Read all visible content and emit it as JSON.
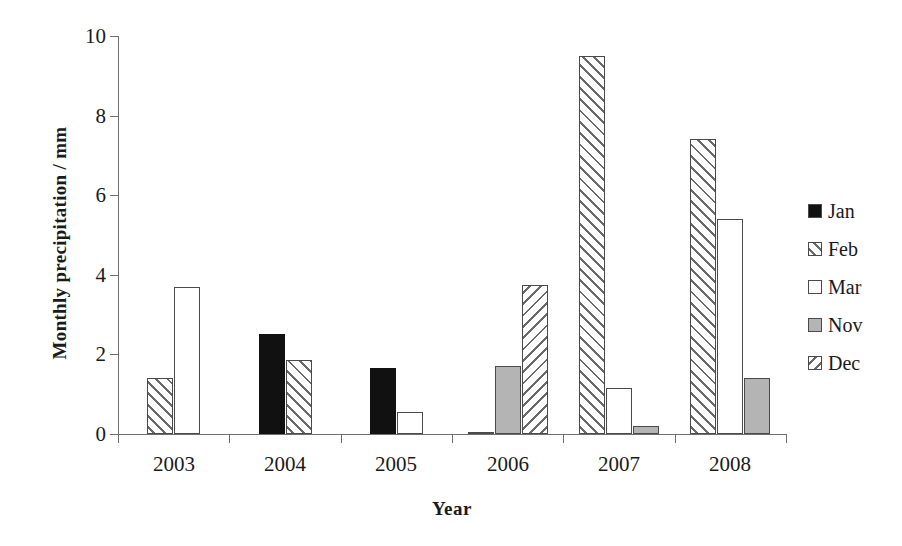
{
  "chart_data": {
    "type": "bar",
    "title": "",
    "xlabel": "Year",
    "ylabel": "Monthly precipitation / mm",
    "categories": [
      "2003",
      "2004",
      "2005",
      "2006",
      "2007",
      "2008"
    ],
    "ylim": [
      0,
      10
    ],
    "yticks": [
      0,
      2,
      4,
      6,
      8,
      10
    ],
    "ytick_labels": [
      "0",
      "2",
      "4",
      "6",
      "8",
      "10"
    ],
    "grid": false,
    "legend_position": "right",
    "series": [
      {
        "name": "Jan",
        "fill": "solid-black",
        "color": "#111111",
        "values": [
          null,
          2.5,
          1.65,
          null,
          null,
          null
        ]
      },
      {
        "name": "Feb",
        "fill": "hatch-forward",
        "color": "#6a6a6a",
        "values": [
          1.4,
          1.85,
          null,
          null,
          9.5,
          7.4
        ]
      },
      {
        "name": "Mar",
        "fill": "white",
        "color": "#ffffff",
        "values": [
          3.7,
          null,
          0.55,
          0.05,
          1.15,
          5.4
        ]
      },
      {
        "name": "Nov",
        "fill": "gray",
        "color": "#b4b4b4",
        "values": [
          null,
          null,
          null,
          1.7,
          0.2,
          1.4
        ]
      },
      {
        "name": "Dec",
        "fill": "hatch-backward",
        "color": "#6a6a6a",
        "values": [
          null,
          null,
          null,
          3.75,
          null,
          null
        ]
      }
    ],
    "bars": [
      {
        "group": "2003",
        "series": "Feb",
        "value": 1.4,
        "fill": "hatch-forward"
      },
      {
        "group": "2003",
        "series": "Mar",
        "value": 3.7,
        "fill": "white"
      },
      {
        "group": "2004",
        "series": "Jan",
        "value": 2.5,
        "fill": "solid-black"
      },
      {
        "group": "2004",
        "series": "Feb",
        "value": 1.85,
        "fill": "hatch-forward"
      },
      {
        "group": "2005",
        "series": "Jan",
        "value": 1.65,
        "fill": "solid-black"
      },
      {
        "group": "2005",
        "series": "Mar",
        "value": 0.55,
        "fill": "white"
      },
      {
        "group": "2006",
        "series": "Mar",
        "value": 0.05,
        "fill": "white"
      },
      {
        "group": "2006",
        "series": "Nov",
        "value": 1.7,
        "fill": "gray"
      },
      {
        "group": "2006",
        "series": "Dec",
        "value": 3.75,
        "fill": "hatch-backward"
      },
      {
        "group": "2007",
        "series": "Feb",
        "value": 9.5,
        "fill": "hatch-forward"
      },
      {
        "group": "2007",
        "series": "Mar",
        "value": 1.15,
        "fill": "white"
      },
      {
        "group": "2007",
        "series": "Nov",
        "value": 0.2,
        "fill": "gray"
      },
      {
        "group": "2008",
        "series": "Feb",
        "value": 7.4,
        "fill": "hatch-forward"
      },
      {
        "group": "2008",
        "series": "Mar",
        "value": 5.4,
        "fill": "white"
      },
      {
        "group": "2008",
        "series": "Nov",
        "value": 1.4,
        "fill": "gray"
      }
    ]
  },
  "legend": {
    "items": [
      {
        "label": "Jan",
        "fill": "solid-black"
      },
      {
        "label": "Feb",
        "fill": "hatch-forward"
      },
      {
        "label": "Mar",
        "fill": "white"
      },
      {
        "label": "Nov",
        "fill": "gray"
      },
      {
        "label": "Dec",
        "fill": "hatch-backward"
      }
    ]
  }
}
